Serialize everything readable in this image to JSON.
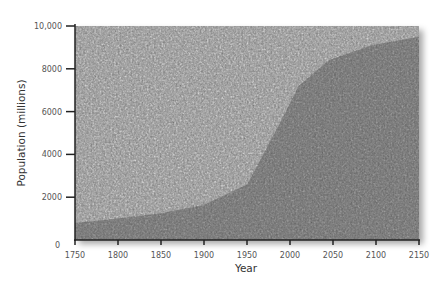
{
  "chart_data": {
    "type": "area",
    "title": "",
    "xlabel": "Year",
    "ylabel": "Population (millions)",
    "xlim": [
      1750,
      2150
    ],
    "ylim": [
      0,
      10000
    ],
    "x_ticks": [
      "1750",
      "1800",
      "1850",
      "1900",
      "1950",
      "2000",
      "2050",
      "2100",
      "2150"
    ],
    "y_ticks": [
      "0",
      "2000",
      "4000",
      "6000",
      "8000",
      "10,000"
    ],
    "grid": false,
    "legend": null,
    "background": "crowd photograph, darker shading under the population curve",
    "series": [
      {
        "name": "World population",
        "x": [
          1750,
          1800,
          1850,
          1900,
          1935,
          1950,
          1965,
          1990,
          2010,
          2045,
          2095,
          2150
        ],
        "values": [
          800,
          1000,
          1250,
          1650,
          2300,
          2600,
          3700,
          5600,
          7200,
          8400,
          9100,
          9500
        ]
      }
    ]
  }
}
